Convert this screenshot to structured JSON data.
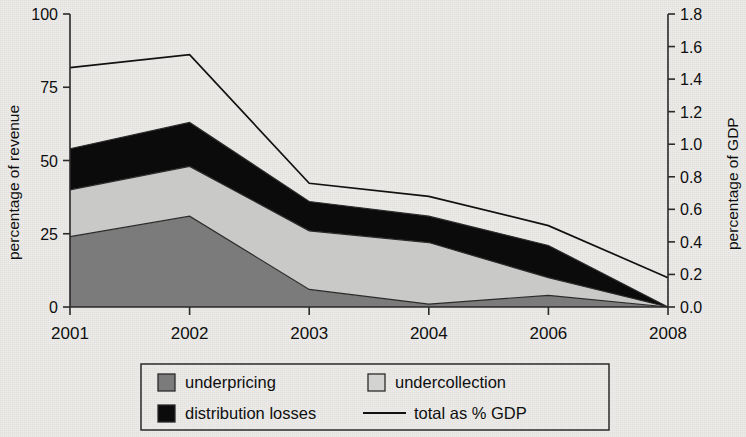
{
  "chart_data": {
    "type": "area",
    "title": "",
    "subtitle": "",
    "xlabel": "",
    "ylabel": "percentage of revenue",
    "y2label": "percentage of GDP",
    "categories": [
      "2001",
      "2002",
      "2003",
      "2004",
      "2006",
      "2008"
    ],
    "ylim": [
      0,
      100
    ],
    "yticks": [
      "0",
      "25",
      "50",
      "75",
      "100"
    ],
    "ytick_values": [
      0,
      25,
      50,
      75,
      100
    ],
    "y2lim": [
      0.0,
      1.8
    ],
    "y2ticks": [
      "0.0",
      "0.2",
      "0.4",
      "0.6",
      "0.8",
      "1.0",
      "1.2",
      "1.4",
      "1.6",
      "1.8"
    ],
    "y2tick_values": [
      0.0,
      0.2,
      0.4,
      0.6,
      0.8,
      1.0,
      1.2,
      1.4,
      1.6,
      1.8
    ],
    "grid": false,
    "legend_position": "bottom",
    "stacked": true,
    "series": [
      {
        "name": "underpricing",
        "kind": "area",
        "axis": "left",
        "color": "#7b7b7b",
        "values": [
          24,
          31,
          6,
          1,
          4,
          0
        ]
      },
      {
        "name": "undercollection",
        "kind": "area",
        "axis": "left",
        "color": "#c9c9c7",
        "values": [
          16,
          17,
          20,
          21,
          6,
          0
        ]
      },
      {
        "name": "distribution losses",
        "kind": "area",
        "axis": "left",
        "color": "#0b0b0b",
        "values": [
          14,
          15,
          10,
          9,
          11,
          0
        ]
      },
      {
        "name": "total as % GDP",
        "kind": "line",
        "axis": "right",
        "color": "#111111",
        "values": [
          1.47,
          1.55,
          0.76,
          0.68,
          0.5,
          0.18
        ]
      }
    ],
    "cumulative_tops_left_axis": {
      "underpricing": [
        24,
        31,
        6,
        1,
        4,
        0
      ],
      "undercollection": [
        40,
        48,
        26,
        22,
        10,
        0
      ],
      "distribution_losses": [
        54,
        63,
        36,
        31,
        21,
        0
      ],
      "total_line_on_left_scale": [
        82,
        86,
        42,
        38,
        28,
        10
      ]
    }
  },
  "legend": {
    "items": [
      {
        "label": "underpricing",
        "marker": "square",
        "color": "#7b7b7b"
      },
      {
        "label": "undercollection",
        "marker": "square",
        "color": "#c9c9c7"
      },
      {
        "label": "distribution losses",
        "marker": "square",
        "color": "#0b0b0b"
      },
      {
        "label": "total as % GDP",
        "marker": "line",
        "color": "#111111"
      }
    ]
  }
}
